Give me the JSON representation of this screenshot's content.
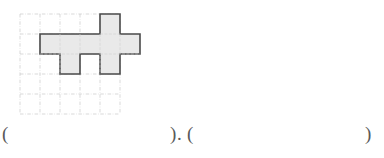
{
  "page": {
    "background": "#ffffff",
    "width": 384,
    "height": 158
  },
  "figure": {
    "name": "grid-polyomino-figure",
    "grid": {
      "columns": 5,
      "rows": 5,
      "cell_size": 20,
      "origin_x": 20,
      "origin_y": 14,
      "line_color": "#c9c9c9",
      "line_style": "dash-dot"
    },
    "shape": {
      "fill_color": "#e9e9e9",
      "stroke_color": "#4a4a4a",
      "stroke_width": 1.6,
      "cell_count": 7,
      "cells": [
        {
          "col": 4,
          "row": 2
        },
        {
          "col": 2,
          "row": 3
        },
        {
          "col": 3,
          "row": 3
        },
        {
          "col": 4,
          "row": 3
        },
        {
          "col": 5,
          "row": 3
        },
        {
          "col": 2,
          "row": 4
        },
        {
          "col": 4,
          "row": 4
        }
      ],
      "outline_points": "60,20 80,20 80,0 100,0 100,20 120,20 120,40 100,40 100,60 80,60 80,40 60,40 60,60 40,60 40,40 20,40 20,20 60,20"
    }
  },
  "answer_line": {
    "paren_open_1": "(",
    "paren_close_1": ")",
    "separator": ".",
    "paren_open_2": "(",
    "paren_close_2": ")",
    "blank_1_value": "",
    "blank_2_value": ""
  }
}
